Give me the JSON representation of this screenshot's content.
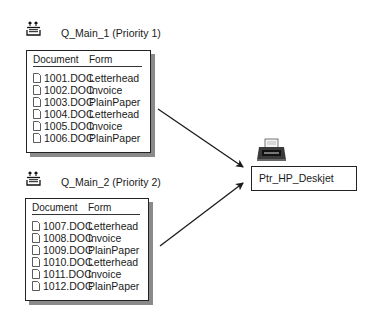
{
  "queues": [
    {
      "label": "Q_Main_1 (Priority 1)",
      "icon": "print-queue-icon",
      "columns": [
        "Document",
        "Form"
      ],
      "rows": [
        {
          "document": "1001.DOC",
          "form": "Letterhead"
        },
        {
          "document": "1002.DOC",
          "form": "Invoice"
        },
        {
          "document": "1003.DOC",
          "form": "PlainPaper"
        },
        {
          "document": "1004.DOC",
          "form": "Letterhead"
        },
        {
          "document": "1005.DOC",
          "form": "Invoice"
        },
        {
          "document": "1006.DOC",
          "form": "PlainPaper"
        }
      ]
    },
    {
      "label": "Q_Main_2 (Priority 2)",
      "icon": "print-queue-icon",
      "columns": [
        "Document",
        "Form"
      ],
      "rows": [
        {
          "document": "1007.DOC",
          "form": "Letterhead"
        },
        {
          "document": "1008.DOC",
          "form": "Invoice"
        },
        {
          "document": "1009.DOC",
          "form": "PlainPaper"
        },
        {
          "document": "1010.DOC",
          "form": "Letterhead"
        },
        {
          "document": "1011.DOC",
          "form": "Invoice"
        },
        {
          "document": "1012.DOC",
          "form": "PlainPaper"
        }
      ]
    }
  ],
  "printer": {
    "label": "Ptr_HP_Deskjet",
    "icon": "printer-icon"
  },
  "colors": {
    "line": "#1a1a1a",
    "shadow": "#8a8a8a",
    "background": "#ffffff"
  }
}
